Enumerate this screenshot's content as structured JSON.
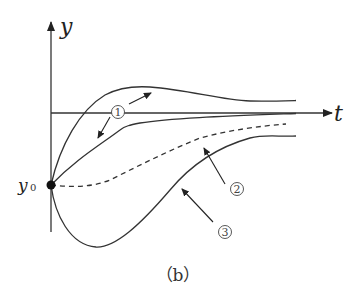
{
  "figure": {
    "caption": "（b）",
    "y_axis_label": "y",
    "t_axis_label": "t",
    "initial_point_label": "y",
    "initial_point_subscript": "0",
    "curve_labels": [
      "1",
      "2",
      "3"
    ],
    "colors": {
      "stroke": "#333333",
      "background": "#ffffff"
    }
  },
  "curves": [
    {
      "id": "curve-1-upper",
      "label": "①",
      "style": "solid",
      "description": "rises from y0 above t-axis, peaks, then settles to t-axis from above"
    },
    {
      "id": "curve-1-lower",
      "label": "①",
      "style": "solid",
      "description": "rises from y0 to just below t-axis, approaches t-axis from below"
    },
    {
      "id": "curve-2",
      "label": "②",
      "style": "dashed",
      "description": "starts flat at y0, rises slowly toward t-axis"
    },
    {
      "id": "curve-3",
      "label": "③",
      "style": "solid",
      "description": "dips below y0 to a minimum, then rises toward t-axis"
    }
  ]
}
